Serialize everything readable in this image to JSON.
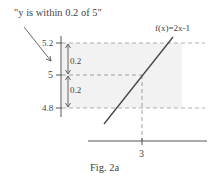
{
  "figure": {
    "caption": "Fig. 2a",
    "annotation": "\"y is within  0.2  of 5\"",
    "function_label": "f(x)=2x-1",
    "y_ticks": [
      {
        "label": "5.2",
        "value": 5.2
      },
      {
        "label": "5",
        "value": 5
      },
      {
        "label": "4.8",
        "value": 4.8
      }
    ],
    "x_ticks": [
      {
        "label": "3",
        "value": 3
      }
    ],
    "interval_labels": [
      "0.2",
      "0.2"
    ],
    "colors": {
      "band": "#f2f2f2",
      "line": "#444444",
      "dashed": "#999999"
    }
  }
}
